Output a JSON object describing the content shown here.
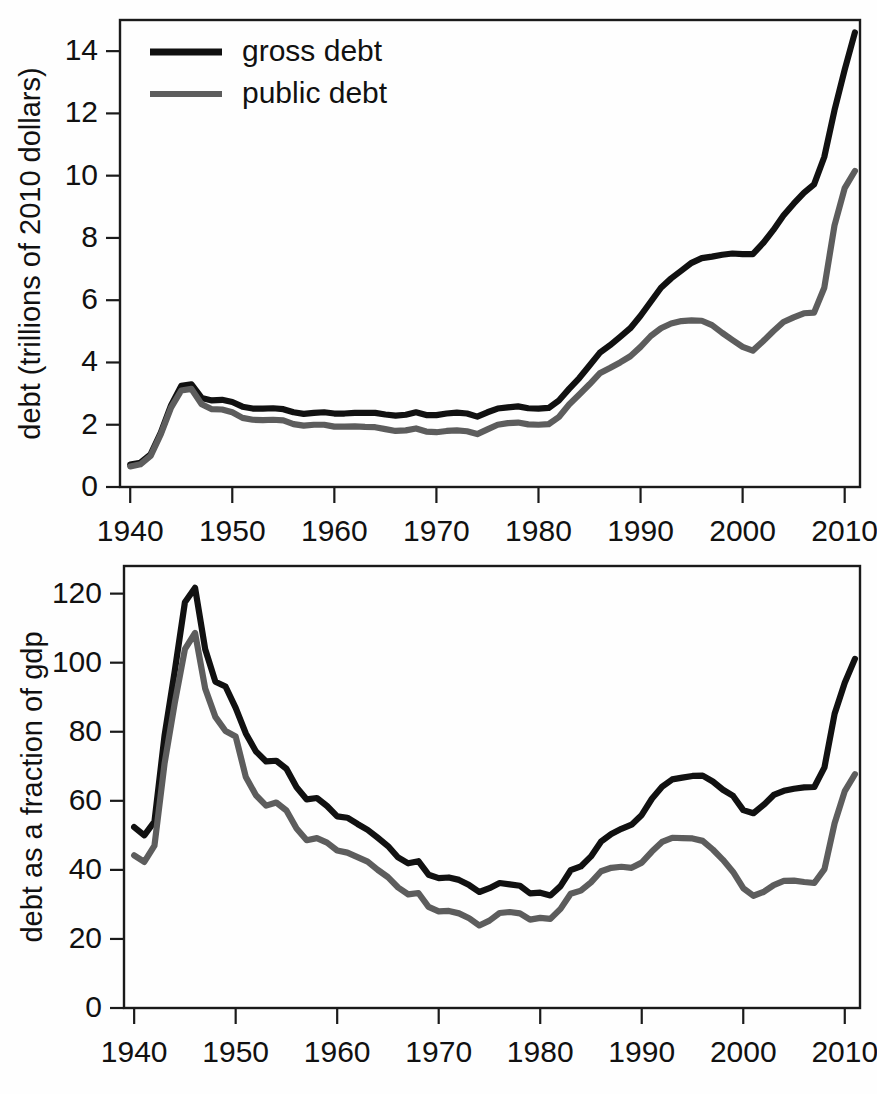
{
  "figure": {
    "title": "",
    "panels": [
      "debt-levels-panel",
      "debt-to-gdp-panel"
    ]
  },
  "legend": {
    "position": "top-left",
    "entries": [
      {
        "label": "gross debt",
        "color": "#111111",
        "key": "gross"
      },
      {
        "label": "public debt",
        "color": "#5d5d5d",
        "key": "public"
      }
    ]
  },
  "colors": {
    "gross": "#111111",
    "public": "#5d5d5d",
    "axis": "#1a1a1a",
    "background": "#ffffff"
  },
  "chart_data": [
    {
      "id": "debt-levels-panel",
      "type": "line",
      "title": "",
      "xlabel": "",
      "ylabel": "debt (trillions of 2010 dollars)",
      "xlim": [
        1939,
        2011.5
      ],
      "ylim": [
        0,
        15
      ],
      "xticks": [
        1940,
        1950,
        1960,
        1970,
        1980,
        1990,
        2000,
        2010
      ],
      "xticklabels": [
        "1940",
        "1950",
        "1960",
        "1970",
        "1980",
        "1990",
        "2000",
        "2010"
      ],
      "yticks": [
        0,
        2,
        4,
        6,
        8,
        10,
        12,
        14
      ],
      "yticklabels": [
        "0",
        "2",
        "4",
        "6",
        "8",
        "10",
        "12",
        "14"
      ],
      "grid": false,
      "legend": "upper left",
      "x": [
        1940,
        1941,
        1942,
        1943,
        1944,
        1945,
        1946,
        1947,
        1948,
        1949,
        1950,
        1951,
        1952,
        1953,
        1954,
        1955,
        1956,
        1957,
        1958,
        1959,
        1960,
        1961,
        1962,
        1963,
        1964,
        1965,
        1966,
        1967,
        1968,
        1969,
        1970,
        1971,
        1972,
        1973,
        1974,
        1975,
        1976,
        1977,
        1978,
        1979,
        1980,
        1981,
        1982,
        1983,
        1984,
        1985,
        1986,
        1987,
        1988,
        1989,
        1990,
        1991,
        1992,
        1993,
        1994,
        1995,
        1996,
        1997,
        1998,
        1999,
        2000,
        2001,
        2002,
        2003,
        2004,
        2005,
        2006,
        2007,
        2008,
        2009,
        2010,
        2011
      ],
      "series": [
        {
          "name": "gross debt",
          "color": "#111111",
          "values": [
            0.72,
            0.78,
            1.05,
            1.75,
            2.62,
            3.25,
            3.3,
            2.86,
            2.78,
            2.8,
            2.73,
            2.58,
            2.52,
            2.52,
            2.53,
            2.5,
            2.4,
            2.35,
            2.38,
            2.4,
            2.36,
            2.36,
            2.38,
            2.38,
            2.38,
            2.33,
            2.29,
            2.32,
            2.4,
            2.31,
            2.31,
            2.36,
            2.39,
            2.36,
            2.26,
            2.4,
            2.52,
            2.56,
            2.59,
            2.53,
            2.52,
            2.54,
            2.78,
            3.15,
            3.5,
            3.9,
            4.31,
            4.55,
            4.82,
            5.1,
            5.5,
            5.95,
            6.4,
            6.7,
            6.95,
            7.2,
            7.35,
            7.4,
            7.46,
            7.5,
            7.48,
            7.48,
            7.83,
            8.25,
            8.72,
            9.1,
            9.45,
            9.72,
            10.6,
            12.1,
            13.4,
            14.6
          ]
        },
        {
          "name": "public debt",
          "color": "#5d5d5d",
          "values": [
            0.66,
            0.73,
            1.0,
            1.7,
            2.55,
            3.1,
            3.15,
            2.66,
            2.5,
            2.49,
            2.4,
            2.22,
            2.16,
            2.15,
            2.16,
            2.14,
            2.02,
            1.97,
            2.0,
            2.0,
            1.94,
            1.94,
            1.95,
            1.93,
            1.92,
            1.86,
            1.8,
            1.82,
            1.88,
            1.78,
            1.76,
            1.8,
            1.82,
            1.79,
            1.7,
            1.85,
            2.0,
            2.05,
            2.07,
            2.01,
            2.0,
            2.02,
            2.25,
            2.65,
            2.97,
            3.3,
            3.65,
            3.82,
            4.0,
            4.2,
            4.5,
            4.85,
            5.1,
            5.25,
            5.33,
            5.35,
            5.34,
            5.2,
            4.95,
            4.72,
            4.5,
            4.38,
            4.68,
            5.0,
            5.3,
            5.45,
            5.58,
            5.6,
            6.4,
            8.4,
            9.6,
            10.15
          ]
        }
      ]
    },
    {
      "id": "debt-to-gdp-panel",
      "type": "line",
      "title": "",
      "xlabel": "",
      "ylabel": "debt as a fraction of gdp",
      "xlim": [
        1939,
        2011.5
      ],
      "ylim": [
        0,
        128
      ],
      "xticks": [
        1940,
        1950,
        1960,
        1970,
        1980,
        1990,
        2000,
        2010
      ],
      "xticklabels": [
        "1940",
        "1950",
        "1960",
        "1970",
        "1980",
        "1990",
        "2000",
        "2010"
      ],
      "yticks": [
        0,
        20,
        40,
        60,
        80,
        100,
        120
      ],
      "yticklabels": [
        "0",
        "20",
        "40",
        "60",
        "80",
        "100",
        "120"
      ],
      "grid": false,
      "legend": "none",
      "x": [
        1940,
        1941,
        1942,
        1943,
        1944,
        1945,
        1946,
        1947,
        1948,
        1949,
        1950,
        1951,
        1952,
        1953,
        1954,
        1955,
        1956,
        1957,
        1958,
        1959,
        1960,
        1961,
        1962,
        1963,
        1964,
        1965,
        1966,
        1967,
        1968,
        1969,
        1970,
        1971,
        1972,
        1973,
        1974,
        1975,
        1976,
        1977,
        1978,
        1979,
        1980,
        1981,
        1982,
        1983,
        1984,
        1985,
        1986,
        1987,
        1988,
        1989,
        1990,
        1991,
        1992,
        1993,
        1994,
        1995,
        1996,
        1997,
        1998,
        1999,
        2000,
        2001,
        2002,
        2003,
        2004,
        2005,
        2006,
        2007,
        2008,
        2009,
        2010,
        2011
      ],
      "series": [
        {
          "name": "gross debt",
          "color": "#111111",
          "values": [
            52.4,
            50.0,
            54.0,
            79.0,
            97.6,
            117.5,
            121.7,
            103.9,
            94.5,
            93.1,
            86.9,
            79.5,
            74.3,
            71.4,
            71.6,
            69.3,
            63.9,
            60.4,
            60.8,
            58.5,
            55.5,
            55.1,
            53.3,
            51.6,
            49.3,
            46.9,
            43.6,
            41.9,
            42.5,
            38.6,
            37.6,
            37.8,
            37.1,
            35.6,
            33.6,
            34.7,
            36.2,
            35.8,
            35.4,
            33.2,
            33.4,
            32.6,
            35.3,
            39.9,
            41.0,
            43.9,
            48.2,
            50.4,
            51.9,
            53.1,
            55.9,
            60.6,
            64.1,
            66.2,
            66.7,
            67.2,
            67.3,
            65.6,
            63.2,
            61.4,
            57.3,
            56.4,
            58.8,
            61.7,
            62.9,
            63.5,
            63.9,
            64.0,
            69.7,
            85.2,
            94.2,
            101.1
          ]
        },
        {
          "name": "public debt",
          "color": "#5d5d5d",
          "values": [
            44.2,
            42.3,
            47.0,
            70.9,
            88.3,
            103.9,
            108.6,
            92.5,
            84.3,
            80.2,
            78.6,
            66.9,
            61.6,
            58.6,
            59.5,
            57.2,
            52.0,
            48.6,
            49.2,
            47.9,
            45.6,
            45.0,
            43.7,
            42.4,
            40.0,
            37.9,
            34.9,
            32.9,
            33.3,
            29.3,
            28.0,
            28.1,
            27.4,
            26.0,
            23.9,
            25.3,
            27.5,
            27.8,
            27.4,
            25.6,
            26.1,
            25.8,
            28.7,
            33.1,
            34.0,
            36.4,
            39.6,
            40.6,
            40.9,
            40.6,
            42.1,
            45.3,
            48.1,
            49.3,
            49.2,
            49.1,
            48.4,
            45.9,
            42.9,
            39.4,
            34.7,
            32.5,
            33.6,
            35.6,
            36.8,
            36.9,
            36.5,
            36.2,
            40.2,
            53.5,
            62.8,
            67.7
          ]
        }
      ]
    }
  ]
}
